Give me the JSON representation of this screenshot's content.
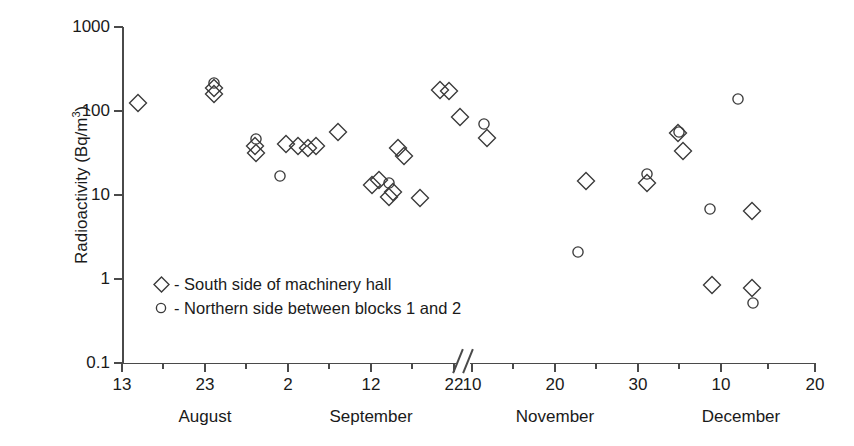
{
  "chart_data": {
    "type": "scatter",
    "title": "",
    "xlabel": "",
    "ylabel": "Radioactivity (Bq/m³)",
    "ylabel_text": "Radioactivity (Bq/m",
    "ylabel_sup": "3",
    "ylabel_tail": ")",
    "yscale": "log",
    "ylim": [
      0.1,
      1000
    ],
    "ytick_labels": [
      "1000",
      "100",
      "10",
      "1",
      "0.1"
    ],
    "ytick_values": [
      1000,
      100,
      10,
      1,
      0.1
    ],
    "grid": false,
    "axis_break": true,
    "axis_break_between": [
      "September 22",
      "November 10"
    ],
    "xtick_labels": [
      "13",
      "23",
      "2",
      "12",
      "22",
      "10",
      "20",
      "30",
      "10",
      "20"
    ],
    "xtick_days": [
      13,
      23,
      2,
      12,
      22,
      10,
      20,
      30,
      10,
      20
    ],
    "month_labels": [
      "August",
      "September",
      "November",
      "December"
    ],
    "legend_position": "inside lower-left",
    "series": [
      {
        "name": "South side of machinery hall",
        "marker": "diamond",
        "legend_label": "- South side of machinery hall",
        "points": [
          {
            "x": 138,
            "y": 125
          },
          {
            "x": 214,
            "y": 160
          },
          {
            "x": 214,
            "y": 190
          },
          {
            "x": 255,
            "y": 38
          },
          {
            "x": 256,
            "y": 32
          },
          {
            "x": 286,
            "y": 40
          },
          {
            "x": 298,
            "y": 38
          },
          {
            "x": 308,
            "y": 36
          },
          {
            "x": 316,
            "y": 38
          },
          {
            "x": 338,
            "y": 57
          },
          {
            "x": 372,
            "y": 13
          },
          {
            "x": 379,
            "y": 15
          },
          {
            "x": 389,
            "y": 9.5
          },
          {
            "x": 393,
            "y": 11
          },
          {
            "x": 398,
            "y": 36
          },
          {
            "x": 404,
            "y": 29
          },
          {
            "x": 420,
            "y": 9.2
          },
          {
            "x": 440,
            "y": 180
          },
          {
            "x": 449,
            "y": 175
          },
          {
            "x": 460,
            "y": 86
          },
          {
            "x": 487,
            "y": 48
          },
          {
            "x": 586,
            "y": 14.5
          },
          {
            "x": 647,
            "y": 14
          },
          {
            "x": 678,
            "y": 55
          },
          {
            "x": 683,
            "y": 33
          },
          {
            "x": 712,
            "y": 0.85
          },
          {
            "x": 752,
            "y": 6.4
          },
          {
            "x": 752,
            "y": 0.78
          }
        ]
      },
      {
        "name": "Northern side between blocks 1 and 2",
        "marker": "circle",
        "legend_label": "- Northern side between blocks 1 and 2",
        "points": [
          {
            "x": 214,
            "y": 215
          },
          {
            "x": 256,
            "y": 47
          },
          {
            "x": 280,
            "y": 17
          },
          {
            "x": 389,
            "y": 14
          },
          {
            "x": 484,
            "y": 70
          },
          {
            "x": 578,
            "y": 2.1
          },
          {
            "x": 647,
            "y": 18
          },
          {
            "x": 679,
            "y": 56
          },
          {
            "x": 710,
            "y": 6.9
          },
          {
            "x": 738,
            "y": 140
          },
          {
            "x": 753,
            "y": 0.52
          }
        ]
      }
    ]
  },
  "axis": {
    "y_ticks": [
      {
        "label": "1000",
        "top": 27
      },
      {
        "label": "100",
        "top": 111
      },
      {
        "label": "10",
        "top": 195
      },
      {
        "label": "1",
        "top": 279
      },
      {
        "label": "0.1",
        "top": 363
      }
    ],
    "x_ticks": [
      {
        "label": "13",
        "left": 122
      },
      {
        "label": "23",
        "left": 205
      },
      {
        "label": "2",
        "left": 288
      },
      {
        "label": "12",
        "left": 371
      },
      {
        "label": "22",
        "left": 454
      },
      {
        "label": "10",
        "left": 472
      },
      {
        "label": "20",
        "left": 555
      },
      {
        "label": "30",
        "left": 638
      },
      {
        "label": "10",
        "left": 721
      },
      {
        "label": "20",
        "left": 815
      }
    ],
    "x_minor_ticks": [
      163,
      246,
      329,
      412,
      513,
      596,
      679,
      768
    ],
    "months": [
      {
        "label": "August",
        "left": 205
      },
      {
        "label": "September",
        "left": 371
      },
      {
        "label": "November",
        "left": 555
      },
      {
        "label": "December",
        "left": 741
      }
    ]
  },
  "legend": {
    "rows": [
      {
        "marker": "diamond",
        "text": "- South side of machinery hall"
      },
      {
        "marker": "circle",
        "text": "- Northern side between blocks 1 and 2"
      }
    ]
  },
  "colors": {
    "axis": "#4a4a4a",
    "marker_stroke": "#3a3a3a",
    "text": "#1a1a1a",
    "background": "#ffffff"
  }
}
